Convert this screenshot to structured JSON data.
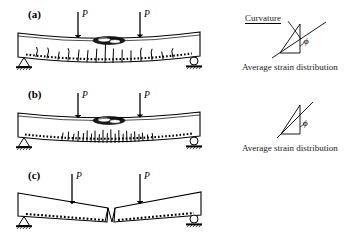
{
  "figure": {
    "background_color": "#ffffff",
    "stroke_color": "#000000",
    "width": 361,
    "height": 243
  },
  "panels": [
    {
      "id": "panel-a",
      "label": "(a)",
      "label_x": 28,
      "label_y": 10,
      "beam": {
        "description": "simply supported beam with downward curvature, flexural cracks and concrete crushing zone",
        "left_x": 18,
        "right_x": 200,
        "top_y": 33,
        "bottom_y": 57,
        "sag": 7
      },
      "loads": [
        {
          "label": "P",
          "x": 78,
          "label_x": 82,
          "label_y": 11,
          "arrow_top_y": 12,
          "arrow_bottom_y": 33
        },
        {
          "label": "P",
          "x": 140,
          "label_x": 144,
          "label_y": 11,
          "arrow_top_y": 12,
          "arrow_bottom_y": 33
        }
      ],
      "supports": [
        {
          "type": "pin-support",
          "x": 24,
          "y": 60
        },
        {
          "type": "roller-support",
          "x": 194,
          "y": 60
        }
      ],
      "crushing_zone": {
        "x": 109,
        "y": 38,
        "rx": 16,
        "ry": 4
      },
      "crack_count": 14,
      "crack_style": "long-flexural-cracks",
      "rebar_style": "dotted-line"
    },
    {
      "id": "panel-b",
      "label": "(b)",
      "label_x": 28,
      "label_y": 91,
      "beam": {
        "description": "simply supported beam with distributed fine cracks and concrete crushing zone",
        "left_x": 18,
        "right_x": 200,
        "top_y": 113,
        "bottom_y": 137,
        "sag": 6
      },
      "loads": [
        {
          "label": "P",
          "x": 78,
          "label_x": 82,
          "label_y": 92,
          "arrow_top_y": 93,
          "arrow_bottom_y": 113
        },
        {
          "label": "P",
          "x": 140,
          "label_x": 144,
          "label_y": 92,
          "arrow_top_y": 93,
          "arrow_bottom_y": 113
        }
      ],
      "supports": [
        {
          "type": "pin-support",
          "x": 24,
          "y": 140
        },
        {
          "type": "roller-support",
          "x": 194,
          "y": 140
        }
      ],
      "crushing_zone": {
        "x": 109,
        "y": 118,
        "rx": 16,
        "ry": 4
      },
      "crack_count": 26,
      "crack_style": "dense-short-cracks",
      "rebar_style": "dotted-line"
    },
    {
      "id": "panel-c",
      "label": "(c)",
      "label_x": 28,
      "label_y": 172,
      "beam": {
        "description": "two rigid segments rotating about a central plastic hinge",
        "left_x": 18,
        "right_x": 200,
        "hinge_x": 111,
        "top_y": 192,
        "bottom_y": 216
      },
      "loads": [
        {
          "label": "P",
          "x": 72,
          "label_x": 76,
          "label_y": 173,
          "arrow_top_y": 174,
          "arrow_bottom_y": 196
        },
        {
          "label": "P",
          "x": 140,
          "label_x": 144,
          "label_y": 173,
          "arrow_top_y": 174,
          "arrow_bottom_y": 196
        }
      ],
      "supports": [
        {
          "type": "pin-support",
          "x": 24,
          "y": 222
        },
        {
          "type": "roller-support",
          "x": 194,
          "y": 222
        }
      ],
      "hinge": {
        "type": "plastic-hinge",
        "x": 111,
        "y": 200
      },
      "rebar_style": "dotted-line"
    }
  ],
  "strain_diagrams": [
    {
      "id": "strain-diagram-a",
      "curvature_label": "Curvature",
      "curvature_label_x": 245,
      "curvature_label_y": 16,
      "caption": "Average strain distribution",
      "caption_x": 242,
      "caption_y": 65,
      "angle_symbol": "ϕ",
      "angle_symbol_x": 306,
      "angle_symbol_y": 41,
      "has_leader_line": true
    },
    {
      "id": "strain-diagram-b",
      "curvature_label": "",
      "caption": "Average strain distribution",
      "caption_x": 242,
      "caption_y": 146,
      "angle_symbol": "ϕ",
      "angle_symbol_x": 297,
      "angle_symbol_y": 124,
      "has_leader_line": false
    }
  ]
}
